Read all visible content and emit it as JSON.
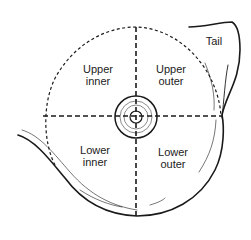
{
  "diagram": {
    "labels": {
      "tail": "Tail",
      "upper_inner": [
        "Upper",
        "inner"
      ],
      "upper_outer": [
        "Upper",
        "outer"
      ],
      "lower_inner": [
        "Lower",
        "inner"
      ],
      "lower_outer": [
        "Lower",
        "outer"
      ]
    },
    "colors": {
      "line": "#1a1a1a",
      "background": "#ffffff"
    }
  }
}
